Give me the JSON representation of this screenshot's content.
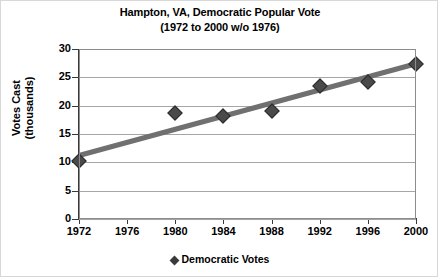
{
  "chart_data": {
    "type": "scatter",
    "title": "Hampton, VA, Democratic Popular Vote",
    "subtitle": "(1972 to 2000 w/o 1976)",
    "xlabel": "",
    "ylabel": "Votes Cast (thousands)",
    "ylabel_line1": "Votes Cast",
    "ylabel_line2": "(thousands)",
    "xlim": [
      1972,
      2000
    ],
    "ylim": [
      0,
      30
    ],
    "yticks": [
      0,
      5,
      10,
      15,
      20,
      25,
      30
    ],
    "xticks": [
      1972,
      1976,
      1980,
      1984,
      1988,
      1992,
      1996,
      2000
    ],
    "grid": "horizontal",
    "legend_position": "bottom",
    "series": [
      {
        "name": "Democratic Votes",
        "marker": "diamond",
        "color": "#4a4a4a",
        "x": [
          1972,
          1980,
          1984,
          1988,
          1992,
          1996,
          2000
        ],
        "values": [
          10.3,
          18.7,
          18.2,
          19.1,
          23.4,
          24.2,
          27.4
        ]
      }
    ],
    "trendline": {
      "name": "linear trend",
      "color": "#707070",
      "x": [
        1972,
        2000
      ],
      "values": [
        11.2,
        27.4
      ]
    }
  },
  "legend": {
    "entry": "Democratic Votes"
  }
}
